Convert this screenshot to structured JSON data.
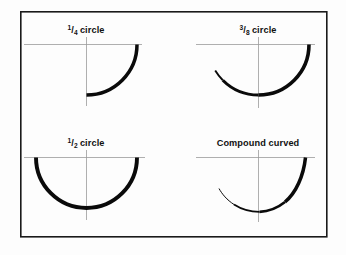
{
  "figure": {
    "title_text": "",
    "background_color": "#fdfdfd",
    "frame_color": "#1a1a1a",
    "guide_color": "#9a9a9a",
    "curve_color": "#0a0a0a",
    "frame": {
      "x": 20,
      "y": 11,
      "width": 307,
      "height": 226
    }
  },
  "panels": [
    {
      "id": "quarter-circle",
      "label_num": "1",
      "label_slash": "/",
      "label_den": "4",
      "label_word": "circle",
      "label_full": "1/4 circle",
      "label_x": 86,
      "label_y": 33,
      "center_x": 86,
      "center_y": 44,
      "radius": 51,
      "h_line": {
        "x1": 24,
        "y1": 44,
        "x2": 142,
        "y2": 44
      },
      "v_line": {
        "x1": 86,
        "y1": 37,
        "x2": 86,
        "y2": 106
      },
      "arc_start_deg": 0,
      "arc_end_deg": 90,
      "arc_sweep_deg": 90,
      "stroke_start": 3.6,
      "stroke_end": 3.2
    },
    {
      "id": "three-eighths-circle",
      "label_num": "3",
      "label_slash": "/",
      "label_den": "8",
      "label_word": "circle",
      "label_full": "3/8 circle",
      "label_x": 258,
      "label_y": 33,
      "center_x": 258,
      "center_y": 44,
      "radius": 51,
      "h_line": {
        "x1": 196,
        "y1": 44,
        "x2": 315,
        "y2": 44
      },
      "v_line": {
        "x1": 258,
        "y1": 37,
        "x2": 258,
        "y2": 108
      },
      "arc_start_deg": 0,
      "arc_end_deg": 135,
      "arc_sweep_deg": 135,
      "stroke_start": 3.6,
      "stroke_end": 2.0
    },
    {
      "id": "half-circle",
      "label_num": "1",
      "label_slash": "/",
      "label_den": "2",
      "label_word": "circle",
      "label_full": "1/2 circle",
      "label_x": 86,
      "label_y": 146,
      "center_x": 86,
      "center_y": 157,
      "radius": 51,
      "h_line": {
        "x1": 24,
        "y1": 157,
        "x2": 145,
        "y2": 157
      },
      "v_line": {
        "x1": 86,
        "y1": 150,
        "x2": 86,
        "y2": 220
      },
      "arc_start_deg": 0,
      "arc_end_deg": 180,
      "arc_sweep_deg": 180,
      "stroke_start": 3.8,
      "stroke_end": 3.8
    },
    {
      "id": "compound-curved",
      "label_word": "Compound curved",
      "label_full": "Compound curved",
      "label_x": 258,
      "label_y": 146,
      "center_x": 258,
      "center_y": 157,
      "h_line": {
        "x1": 196,
        "y1": 157,
        "x2": 315,
        "y2": 157
      },
      "v_line": {
        "x1": 258,
        "y1": 150,
        "x2": 258,
        "y2": 222
      },
      "path_note": "steep thick arc from top-right descending to bottom near axis, then flattening and thinning toward upper-left",
      "stroke_start": 3.6,
      "stroke_end": 0.8
    }
  ]
}
